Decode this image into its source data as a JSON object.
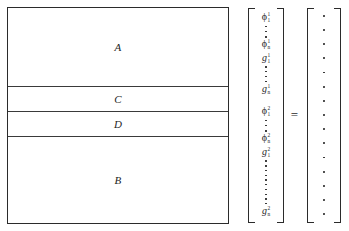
{
  "figure": {
    "background_color": "#ffffff",
    "line_color": "#2b2b2b",
    "equals_symbol": "="
  },
  "matrix_block": {
    "name": "partitioned-coefficient-matrix",
    "bands": [
      {
        "label": "A"
      },
      {
        "label": "C"
      },
      {
        "label": "D"
      },
      {
        "label": "B"
      }
    ]
  },
  "unknown_vector": {
    "bracket_style": "square",
    "entries": [
      {
        "kind": "symbol",
        "base": "ϕ",
        "sup": "1",
        "sub": "1"
      },
      {
        "kind": "vdots",
        "length": "short",
        "dots": 3
      },
      {
        "kind": "symbol",
        "base": "ϕ",
        "sup": "1",
        "sub": "n"
      },
      {
        "kind": "symbol",
        "base": "g",
        "sup": "1",
        "sub": "1"
      },
      {
        "kind": "vdots",
        "length": "mid",
        "dots": 4
      },
      {
        "kind": "symbol",
        "base": "g",
        "sup": "1",
        "sub": "n"
      },
      {
        "kind": "gap"
      },
      {
        "kind": "symbol",
        "base": "ϕ",
        "sup": "2",
        "sub": "1"
      },
      {
        "kind": "vdots",
        "length": "short",
        "dots": 3
      },
      {
        "kind": "symbol",
        "base": "ϕ",
        "sup": "2",
        "sub": "n"
      },
      {
        "kind": "symbol",
        "base": "g",
        "sup": "2",
        "sub": "1"
      },
      {
        "kind": "vdots",
        "length": "long",
        "dots": 10
      },
      {
        "kind": "symbol",
        "base": "g",
        "sup": "2",
        "sub": "n"
      }
    ]
  },
  "rhs_vector": {
    "bracket_style": "square",
    "entry_count": 15,
    "entry_glyph": "dot"
  }
}
